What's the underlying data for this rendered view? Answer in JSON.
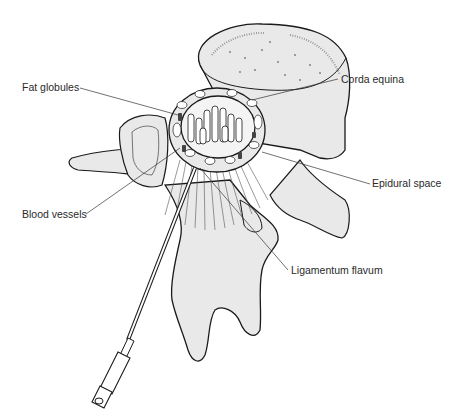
{
  "diagram": {
    "colors": {
      "bone_fill": "#e9e9e9",
      "outline": "#1a1a1a",
      "leader": "#333333",
      "text": "#2a2a2a"
    },
    "labels": [
      {
        "id": "fat-globules",
        "text": "Fat globules",
        "x": 22,
        "y": 81
      },
      {
        "id": "corda-equina",
        "text": "Corda equina",
        "x": 341,
        "y": 73
      },
      {
        "id": "epidural-space",
        "text": "Epidural space",
        "x": 372,
        "y": 177
      },
      {
        "id": "blood-vessels",
        "text": "Blood vessels",
        "x": 22,
        "y": 208
      },
      {
        "id": "ligamentum-flavum",
        "text": "Ligamentum flavum",
        "x": 291,
        "y": 264
      }
    ]
  }
}
